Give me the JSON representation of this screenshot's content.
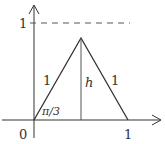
{
  "diagram": {
    "axes": {
      "origin_label": "0",
      "x_tick_label": "1",
      "y_tick_label": "1"
    },
    "triangle": {
      "left_side_label": "1",
      "right_side_label": "1",
      "height_label": "h",
      "angle_label": "π/3"
    },
    "colors": {
      "stroke": "#333333",
      "dashed": "#555555",
      "background": "#ffffff"
    }
  }
}
